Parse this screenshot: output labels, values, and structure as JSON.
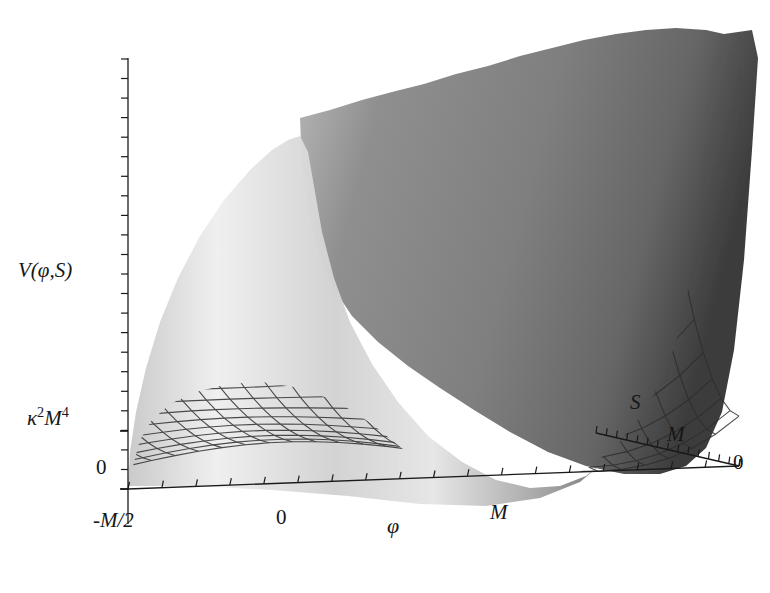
{
  "figure": {
    "kind": "3d-surface-plot",
    "style": "grayscale-mesh",
    "background": "#ffffff",
    "mesh_line_color": "#2b2b2b",
    "width": 770,
    "height": 593
  },
  "axes": {
    "vertical": {
      "name": "V(φ,S)",
      "label_parts": {
        "v": "V(",
        "phi": "φ",
        "comma": ",",
        "s": "S",
        "close": ")"
      },
      "ticks": [
        {
          "label": "0",
          "value": 0
        },
        {
          "label": "κ²M⁴",
          "value": 1
        }
      ],
      "tick_kappa_parts": {
        "kappa": "κ",
        "exp1": "2",
        "m": "M",
        "exp2": "4"
      },
      "minor_tick_count": 22
    },
    "phi": {
      "name": "φ",
      "ticks": [
        {
          "label": "-M/2",
          "value": -0.5
        },
        {
          "label": "0",
          "value": 0
        },
        {
          "label": "M",
          "value": 1
        }
      ],
      "range": [
        -0.5,
        1.45
      ],
      "minor_tick_count": 18
    },
    "s": {
      "name": "S",
      "ticks": [
        {
          "label": "0",
          "value": 0
        },
        {
          "label": "M",
          "value": 1
        }
      ],
      "range": [
        0,
        1.6
      ],
      "minor_tick_count": 14
    }
  },
  "chart_data": {
    "type": "surface",
    "title": "",
    "xlabel": "φ",
    "ylabel": "S",
    "zlabel": "V(φ,S)",
    "xlim": [
      -0.5,
      1.45
    ],
    "ylim": [
      0,
      1.6
    ],
    "zlim": [
      0,
      3.2
    ],
    "grid": true,
    "legend": false,
    "features": [
      {
        "name": "global-minimum",
        "phi": 1.0,
        "S": 0.0,
        "V": 0.0
      },
      {
        "name": "central-valley",
        "phi": 0.0,
        "S": 0.0,
        "V": 0.45
      },
      {
        "name": "plateau-height",
        "phi": 0.0,
        "S": 1.6,
        "V": 1.0
      },
      {
        "name": "left-wall-peak",
        "phi": -0.5,
        "S": 1.6,
        "V": 2.95
      },
      {
        "name": "right-wall-peak",
        "phi": 1.45,
        "S": 1.6,
        "V": 3.2
      }
    ],
    "surface_shading": {
      "light_gray": "#e8e8e8",
      "mid_gray": "#b4b4b4",
      "dark_gray": "#6e6e6e",
      "darkest_gray": "#3c3c3c"
    }
  }
}
